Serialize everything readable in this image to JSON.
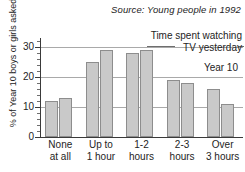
{
  "source_note": "Source: Young people in 1992",
  "annotation": {
    "line1": "Time spent watching",
    "line2": "TV yesterday",
    "series_label": "Year 10"
  },
  "axes": {
    "ylabel": "% of Year 10 boys or girls asked",
    "ytick_labels": [
      "0",
      "10",
      "20",
      "30"
    ],
    "xtick_labels": [
      {
        "line1": "None",
        "line2": "at all"
      },
      {
        "line1": "Up to",
        "line2": "1 hour"
      },
      {
        "line1": "1-2",
        "line2": "hours"
      },
      {
        "line1": "2-3",
        "line2": "hours"
      },
      {
        "line1": "Over",
        "line2": "3 hours"
      }
    ]
  },
  "colors": {
    "bar_fill": "#c9c9c9",
    "bar_stroke": "#8d8d8d",
    "gridline": "#a9a9a9",
    "axis": "#3a3a3a",
    "text": "#242424",
    "background": "#ffffff"
  },
  "chart_data": {
    "type": "bar",
    "title": "Time spent watching TV yesterday",
    "subtitle": "Year 10",
    "source": "Source: Young people in 1992",
    "categories": [
      "None at all",
      "Up to 1 hour",
      "1-2 hours",
      "2-3 hours",
      "Over 3 hours"
    ],
    "series": [
      {
        "name": "boys",
        "values": [
          12,
          25,
          28,
          19,
          16
        ]
      },
      {
        "name": "girls",
        "values": [
          13,
          29,
          29,
          18,
          11
        ]
      }
    ],
    "xlabel": "",
    "ylabel": "% of Year 10 boys or girls asked",
    "ylim": [
      0,
      33
    ],
    "yticks": [
      0,
      10,
      20,
      30
    ],
    "minor_tick_step": 2,
    "grid": true,
    "legend": "none"
  }
}
